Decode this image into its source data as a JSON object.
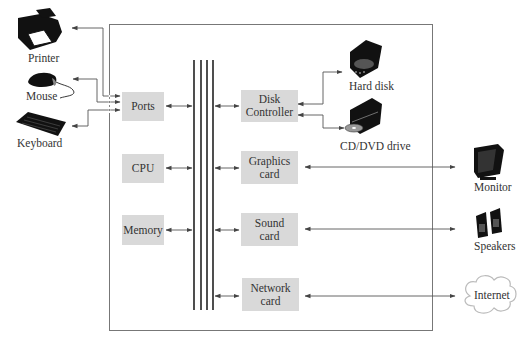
{
  "diagram": {
    "internal_components": {
      "ports": "Ports",
      "cpu": "CPU",
      "memory": "Memory",
      "disk_controller_line1": "Disk",
      "disk_controller_line2": "Controller",
      "graphics_card_line1": "Graphics",
      "graphics_card_line2": "card",
      "sound_card_line1": "Sound",
      "sound_card_line2": "card",
      "network_card_line1": "Network",
      "network_card_line2": "card"
    },
    "external_devices": {
      "printer": "Printer",
      "mouse": "Mouse",
      "keyboard": "Keyboard",
      "hard_disk": "Hard disk",
      "cd_dvd_drive": "CD/DVD drive",
      "monitor": "Monitor",
      "speakers": "Speakers",
      "internet": "Internet"
    },
    "colors": {
      "component_fill": "#d9d9d9",
      "line": "#555555",
      "bus": "#222222"
    }
  }
}
